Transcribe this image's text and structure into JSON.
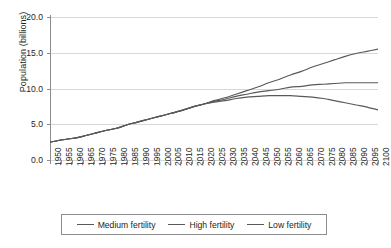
{
  "chart_data": {
    "type": "line",
    "title": "",
    "xlabel": "",
    "ylabel": "Population (billions)",
    "ylim": [
      0.0,
      20.0
    ],
    "xlim": [
      1950,
      2100
    ],
    "grid": true,
    "legend_position": "bottom",
    "ytick_labels": [
      "0.0",
      "5.0",
      "10.0",
      "15.0",
      "20.0"
    ],
    "ytick_values": [
      0.0,
      5.0,
      10.0,
      15.0,
      20.0
    ],
    "categories": [
      "1950",
      "1955",
      "1960",
      "1965",
      "1970",
      "1975",
      "1980",
      "1985",
      "1990",
      "1995",
      "2000",
      "2005",
      "2010",
      "2015",
      "2020",
      "2025",
      "2030",
      "2035",
      "2040",
      "2045",
      "2050",
      "2055",
      "2060",
      "2065",
      "2070",
      "2075",
      "2080",
      "2085",
      "2090",
      "2095",
      "2100"
    ],
    "series": [
      {
        "name": "Medium fertility",
        "color": "#595959",
        "values": [
          2.5,
          2.8,
          3.0,
          3.3,
          3.7,
          4.1,
          4.4,
          4.9,
          5.3,
          5.7,
          6.1,
          6.5,
          6.9,
          7.4,
          7.8,
          8.2,
          8.5,
          8.9,
          9.2,
          9.5,
          9.7,
          9.9,
          10.2,
          10.3,
          10.5,
          10.6,
          10.7,
          10.8,
          10.8,
          10.8,
          10.8
        ]
      },
      {
        "name": "High fertility",
        "color": "#595959",
        "values": [
          2.5,
          2.8,
          3.0,
          3.3,
          3.7,
          4.1,
          4.4,
          4.9,
          5.3,
          5.7,
          6.1,
          6.5,
          6.9,
          7.4,
          7.8,
          8.3,
          8.7,
          9.2,
          9.7,
          10.2,
          10.8,
          11.3,
          11.9,
          12.4,
          13.0,
          13.5,
          14.0,
          14.5,
          14.9,
          15.2,
          15.5
        ]
      },
      {
        "name": "Low fertility",
        "color": "#595959",
        "values": [
          2.5,
          2.8,
          3.0,
          3.3,
          3.7,
          4.1,
          4.4,
          4.9,
          5.3,
          5.7,
          6.1,
          6.5,
          6.9,
          7.4,
          7.8,
          8.1,
          8.3,
          8.6,
          8.8,
          8.9,
          9.0,
          9.0,
          9.0,
          8.9,
          8.8,
          8.6,
          8.3,
          8.0,
          7.7,
          7.4,
          7.0
        ]
      }
    ]
  },
  "axis": {
    "y_title": "Population (billions)"
  },
  "legend": {
    "items": [
      {
        "label": "Medium fertility"
      },
      {
        "label": "High fertility"
      },
      {
        "label": "Low fertility"
      }
    ]
  }
}
